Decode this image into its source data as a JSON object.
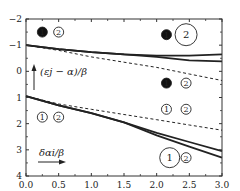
{
  "chart_data": {
    "type": "line",
    "title": "",
    "xlabel": "δα_i/β",
    "ylabel": "(ε_j − α)/β",
    "xlim": [
      0.0,
      3.0
    ],
    "ylim": [
      4,
      -2
    ],
    "y_inverted": true,
    "grid": false,
    "x_ticks": [
      "0.0",
      "0.5",
      "1.0",
      "1.5",
      "2.0",
      "2.5",
      "3.0"
    ],
    "y_ticks": [
      "-2",
      "-1",
      "0",
      "1",
      "2",
      "3",
      "4"
    ],
    "series": [
      {
        "name": "upper-solid-a",
        "style": "solid",
        "x": [
          0.0,
          0.5,
          1.0,
          1.5,
          2.0,
          2.5,
          3.0
        ],
        "y": [
          -1.0,
          -0.85,
          -0.73,
          -0.65,
          -0.6,
          -0.6,
          -0.65
        ]
      },
      {
        "name": "upper-solid-b",
        "style": "solid",
        "x": [
          0.0,
          0.5,
          1.0,
          1.5,
          2.0,
          2.5,
          3.0
        ],
        "y": [
          -1.0,
          -0.85,
          -0.73,
          -0.65,
          -0.55,
          -0.42,
          -0.38
        ]
      },
      {
        "name": "upper-dashed",
        "style": "dashed",
        "x": [
          0.0,
          0.5,
          1.0,
          1.5,
          2.0,
          2.5,
          3.0
        ],
        "y": [
          -1.0,
          -0.8,
          -0.55,
          -0.35,
          -0.15,
          0.1,
          0.35
        ]
      },
      {
        "name": "lower-solid-a",
        "style": "solid",
        "x": [
          0.0,
          0.5,
          1.0,
          1.5,
          2.0,
          2.5,
          3.0
        ],
        "y": [
          0.95,
          1.3,
          1.6,
          1.95,
          2.35,
          2.7,
          3.05
        ]
      },
      {
        "name": "lower-solid-b",
        "style": "solid",
        "x": [
          0.0,
          0.5,
          1.0,
          1.5,
          2.0,
          2.5,
          3.0
        ],
        "y": [
          0.95,
          1.3,
          1.6,
          1.95,
          2.45,
          2.88,
          3.3
        ]
      },
      {
        "name": "lower-dashed",
        "style": "dashed",
        "x": [
          0.0,
          0.5,
          1.0,
          1.5,
          2.0,
          2.5,
          3.0
        ],
        "y": [
          0.95,
          1.25,
          1.45,
          1.65,
          1.85,
          2.05,
          2.25
        ]
      }
    ],
    "annotations": [
      {
        "text": "1",
        "filled": true,
        "x": 0.25,
        "y": -1.5,
        "r": 5
      },
      {
        "text": "2",
        "filled": false,
        "x": 0.5,
        "y": -1.5,
        "r": 5
      },
      {
        "text": "1",
        "filled": true,
        "x": 2.15,
        "y": -1.4,
        "r": 5
      },
      {
        "text": "2",
        "filled": false,
        "x": 2.45,
        "y": -1.4,
        "r": 11
      },
      {
        "text": "1",
        "filled": true,
        "x": 2.15,
        "y": 0.45,
        "r": 5
      },
      {
        "text": "2",
        "filled": false,
        "x": 2.45,
        "y": 0.45,
        "r": 5
      },
      {
        "text": "1",
        "filled": false,
        "x": 2.15,
        "y": 1.45,
        "r": 5
      },
      {
        "text": "2",
        "filled": false,
        "x": 2.45,
        "y": 1.45,
        "r": 5
      },
      {
        "text": "1",
        "filled": false,
        "x": 0.25,
        "y": 1.75,
        "r": 5
      },
      {
        "text": "2",
        "filled": false,
        "x": 0.5,
        "y": 1.75,
        "r": 5
      },
      {
        "text": "1",
        "filled": false,
        "x": 2.2,
        "y": 3.3,
        "r": 10
      },
      {
        "text": "2",
        "filled": false,
        "x": 2.45,
        "y": 3.3,
        "r": 5
      }
    ]
  },
  "labels": {
    "ylabel": "(εj − α)/β",
    "xlabel": "δαi/β"
  }
}
